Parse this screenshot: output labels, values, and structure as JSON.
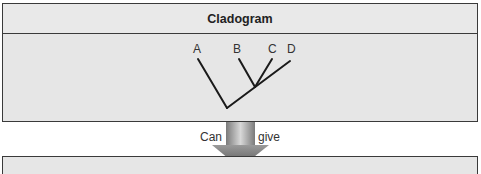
{
  "top_box": {
    "title": "Cladogram",
    "taxa": [
      {
        "label": "A"
      },
      {
        "label": "B"
      },
      {
        "label": "C"
      },
      {
        "label": "D"
      }
    ]
  },
  "arrow": {
    "left_label": "Can",
    "right_label": "give"
  },
  "bottom_box": {
    "text": ""
  },
  "colors": {
    "box_fill": "#e6e6e6",
    "border": "#3a3a3a",
    "arrow_light": "#d0d0d0",
    "arrow_dark": "#6a6a6a"
  }
}
